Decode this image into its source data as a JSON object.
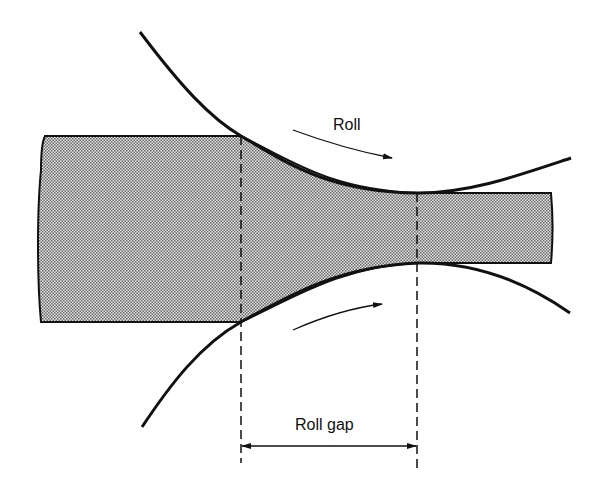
{
  "diagram": {
    "labels": {
      "roll": "Roll",
      "roll_gap": "Roll gap"
    },
    "elements": [
      {
        "name": "workpiece-strip",
        "description": "Stippled metal strip, thick on entry (left) and thin on exit (right)"
      },
      {
        "name": "upper-roll-arc",
        "description": "Upper roll surface contacting strip from entry point to exit point"
      },
      {
        "name": "lower-roll-arc",
        "description": "Lower roll surface contacting strip from entry point to exit point"
      },
      {
        "name": "roll-rotation-arrows",
        "description": "Curved arrows showing roll rotation toward exit direction"
      },
      {
        "name": "roll-gap-dimension",
        "description": "Dimension line between entry and exit dashed lines labeled Roll gap"
      }
    ],
    "colors": {
      "line": "#111111",
      "fill_stipple": "#b8b8b8",
      "background": "#ffffff"
    }
  }
}
